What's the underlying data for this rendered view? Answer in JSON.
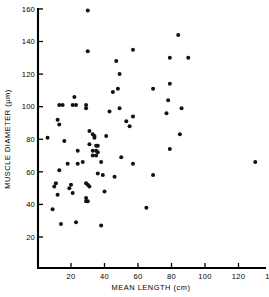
{
  "chart_data": {
    "type": "scatter",
    "title": "",
    "xlabel": "MEAN LENGTH (cm)",
    "ylabel": "MUSCLE DIAMETER (µm)",
    "xlim": [
      0,
      140
    ],
    "ylim": [
      10,
      160
    ],
    "grid": false,
    "legend": null,
    "xticks": [
      20,
      40,
      60,
      80,
      100,
      120,
      140
    ],
    "yticks": [
      20,
      40,
      60,
      80,
      100,
      120,
      140,
      160
    ],
    "xtick_labels": [
      "20",
      "40",
      "60",
      "80",
      "100",
      "120",
      "140"
    ],
    "ytick_labels": [
      "20",
      "40",
      "60",
      "80",
      "100",
      "120",
      "140",
      "160"
    ],
    "marker": "filled-circle",
    "marker_color": "#111111",
    "n_points": 80,
    "points": [
      {
        "x": 30,
        "y": 159
      },
      {
        "x": 84,
        "y": 144
      },
      {
        "x": 30,
        "y": 134
      },
      {
        "x": 57,
        "y": 135
      },
      {
        "x": 90,
        "y": 130
      },
      {
        "x": 79,
        "y": 130
      },
      {
        "x": 47,
        "y": 128
      },
      {
        "x": 49,
        "y": 120
      },
      {
        "x": 69,
        "y": 111
      },
      {
        "x": 79,
        "y": 114
      },
      {
        "x": 48,
        "y": 111
      },
      {
        "x": 45,
        "y": 109
      },
      {
        "x": 78,
        "y": 104
      },
      {
        "x": 22,
        "y": 106
      },
      {
        "x": 13,
        "y": 101
      },
      {
        "x": 15,
        "y": 101
      },
      {
        "x": 21,
        "y": 101
      },
      {
        "x": 23,
        "y": 101
      },
      {
        "x": 29,
        "y": 101
      },
      {
        "x": 29,
        "y": 99
      },
      {
        "x": 49,
        "y": 99
      },
      {
        "x": 86,
        "y": 99
      },
      {
        "x": 43,
        "y": 97
      },
      {
        "x": 77,
        "y": 96
      },
      {
        "x": 57,
        "y": 94
      },
      {
        "x": 12,
        "y": 92
      },
      {
        "x": 13,
        "y": 89
      },
      {
        "x": 53,
        "y": 91
      },
      {
        "x": 55,
        "y": 88
      },
      {
        "x": 85,
        "y": 83
      },
      {
        "x": 31,
        "y": 85
      },
      {
        "x": 33,
        "y": 83
      },
      {
        "x": 34,
        "y": 82
      },
      {
        "x": 34,
        "y": 81
      },
      {
        "x": 41,
        "y": 82
      },
      {
        "x": 16,
        "y": 79
      },
      {
        "x": 6,
        "y": 81
      },
      {
        "x": 31,
        "y": 77
      },
      {
        "x": 35,
        "y": 76
      },
      {
        "x": 36,
        "y": 76
      },
      {
        "x": 79,
        "y": 74
      },
      {
        "x": 24,
        "y": 73
      },
      {
        "x": 33,
        "y": 73
      },
      {
        "x": 35,
        "y": 73
      },
      {
        "x": 36,
        "y": 72
      },
      {
        "x": 33,
        "y": 70
      },
      {
        "x": 35,
        "y": 70
      },
      {
        "x": 50,
        "y": 69
      },
      {
        "x": 27,
        "y": 66
      },
      {
        "x": 38,
        "y": 66
      },
      {
        "x": 130,
        "y": 66
      },
      {
        "x": 18,
        "y": 65
      },
      {
        "x": 24,
        "y": 65
      },
      {
        "x": 57,
        "y": 65
      },
      {
        "x": 13,
        "y": 61
      },
      {
        "x": 36,
        "y": 59
      },
      {
        "x": 39,
        "y": 58
      },
      {
        "x": 69,
        "y": 58
      },
      {
        "x": 46,
        "y": 57
      },
      {
        "x": 11,
        "y": 53
      },
      {
        "x": 10,
        "y": 51
      },
      {
        "x": 20,
        "y": 52
      },
      {
        "x": 29,
        "y": 53
      },
      {
        "x": 30,
        "y": 52
      },
      {
        "x": 31,
        "y": 51
      },
      {
        "x": 40,
        "y": 48
      },
      {
        "x": 12,
        "y": 46
      },
      {
        "x": 21,
        "y": 47
      },
      {
        "x": 19,
        "y": 50
      },
      {
        "x": 29,
        "y": 44
      },
      {
        "x": 29,
        "y": 42
      },
      {
        "x": 30,
        "y": 42
      },
      {
        "x": 65,
        "y": 38
      },
      {
        "x": 9,
        "y": 37
      },
      {
        "x": 14,
        "y": 28
      },
      {
        "x": 23,
        "y": 29
      },
      {
        "x": 38,
        "y": 27
      }
    ]
  }
}
